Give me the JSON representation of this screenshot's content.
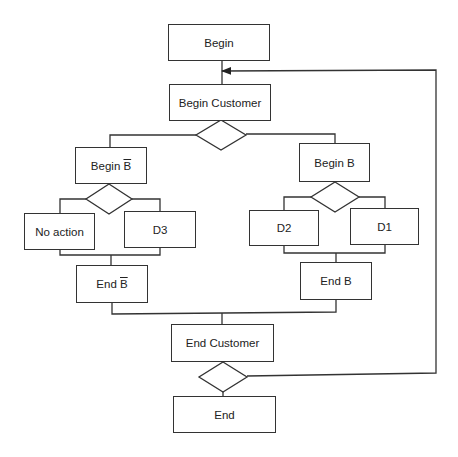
{
  "diagram": {
    "type": "structured flowchart (Jackson-style)",
    "colors": {
      "line": "#333333",
      "background": "#ffffff",
      "text": "#222222"
    },
    "nodes": {
      "begin": {
        "label": "Begin"
      },
      "begin_customer": {
        "label": "Begin Customer"
      },
      "begin_not_b": {
        "label": "Begin ",
        "bar": "B"
      },
      "no_action": {
        "label": "No action"
      },
      "d3": {
        "label": "D3"
      },
      "end_not_b": {
        "label": "End ",
        "bar": "B"
      },
      "begin_b": {
        "label": "Begin B"
      },
      "d2": {
        "label": "D2"
      },
      "d1": {
        "label": "D1"
      },
      "end_b": {
        "label": "End B"
      },
      "end_customer": {
        "label": "End Customer"
      },
      "end": {
        "label": "End"
      }
    },
    "decisions": [
      {
        "id": "customer-branch-decision",
        "after": "Begin Customer",
        "branches": [
          "Begin B̄",
          "Begin B"
        ]
      },
      {
        "id": "not-b-decision",
        "after": "Begin B̄",
        "branches": [
          "No action",
          "D3"
        ]
      },
      {
        "id": "b-decision",
        "after": "Begin B",
        "branches": [
          "D2",
          "D1"
        ]
      },
      {
        "id": "loop-decision",
        "after": "End Customer",
        "branches": [
          "End",
          "loop back to Begin Customer"
        ]
      }
    ]
  }
}
